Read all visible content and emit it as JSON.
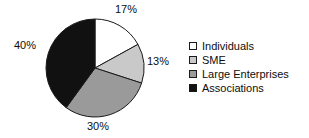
{
  "chart_data": {
    "type": "pie",
    "title": "",
    "subtitle": "",
    "xlabel": "",
    "ylabel": "",
    "grid": false,
    "legend_position": "right",
    "start_angle_deg": 0,
    "direction": "clockwise",
    "center": {
      "cx": 95,
      "cy": 68
    },
    "radius": 49,
    "categories": [
      "Individuals",
      "SME",
      "Large Enterprises",
      "Associations"
    ],
    "values": [
      17,
      13,
      30,
      40
    ],
    "value_unit": "%",
    "data_labels": [
      "17%",
      "13%",
      "30%",
      "40%"
    ],
    "slice_colors": [
      "#ffffff",
      "#c9c9c9",
      "#9a9a9a",
      "#111111"
    ],
    "slice_edge_color": "#1a1a1a",
    "slices": [
      {
        "label": "Individuals",
        "value": 17,
        "data_label": "17%",
        "color": "#ffffff"
      },
      {
        "label": "SME",
        "value": 13,
        "data_label": "13%",
        "color": "#c9c9c9"
      },
      {
        "label": "Large Enterprises",
        "value": 30,
        "data_label": "30%",
        "color": "#9a9a9a"
      },
      {
        "label": "Associations",
        "value": 40,
        "data_label": "40%",
        "color": "#111111"
      }
    ]
  },
  "labels": {
    "individuals_pct": "17%",
    "sme_pct": "13%",
    "large_pct": "30%",
    "associations_pct": "40%"
  },
  "legend": {
    "items": [
      {
        "label": "Individuals",
        "color": "#ffffff"
      },
      {
        "label": "SME",
        "color": "#c9c9c9"
      },
      {
        "label": "Large Enterprises",
        "color": "#9a9a9a"
      },
      {
        "label": "Associations",
        "color": "#111111"
      }
    ]
  }
}
